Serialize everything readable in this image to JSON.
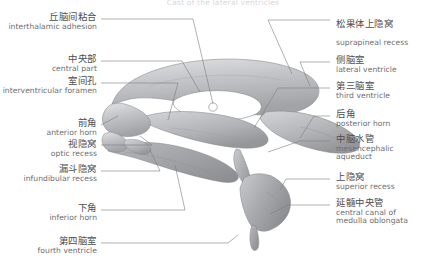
{
  "title": "Cast of the lateral ventricles",
  "figure": {
    "name": "lateral-ventricles-cast",
    "view": "lateral view",
    "palette": {
      "outline": "#6f6f73",
      "fill_light": "#d7d8da",
      "fill_mid": "#b9babd",
      "fill_dark": "#9a9b9f",
      "leader": "#7c7c80",
      "text_cn": "#4d4d4f",
      "text_en": "#6e6e72",
      "background": "#ffffff"
    }
  },
  "labels_left": [
    {
      "cn": "丘脑间粘合",
      "en": "interthalamic adhesion"
    },
    {
      "cn": "中央部",
      "en": "central part"
    },
    {
      "cn": "室间孔",
      "en": "interventricular foramen"
    },
    {
      "cn": "前角",
      "en": "anterior horn"
    },
    {
      "cn": "视隐窝",
      "en": "optic recess"
    },
    {
      "cn": "漏斗隐窝",
      "en": "infundibular recess"
    },
    {
      "cn": "下角",
      "en": "inferior horn"
    },
    {
      "cn": "第四脑室",
      "en": "fourth ventricle"
    }
  ],
  "labels_right": [
    {
      "cn": "松果体上隐窝",
      "en": "suprapineal recess"
    },
    {
      "cn": "侧脑室",
      "en": "lateral ventricle"
    },
    {
      "cn": "第三脑室",
      "en": "third ventricle"
    },
    {
      "cn": "后角",
      "en": "posterior horn"
    },
    {
      "cn": "中脑水管",
      "en": "mesencephalic aqueduct"
    },
    {
      "cn": "上隐窝",
      "en": "superior recess"
    },
    {
      "cn": "延髓中央管",
      "en": "central canal of medulla oblongata"
    }
  ]
}
